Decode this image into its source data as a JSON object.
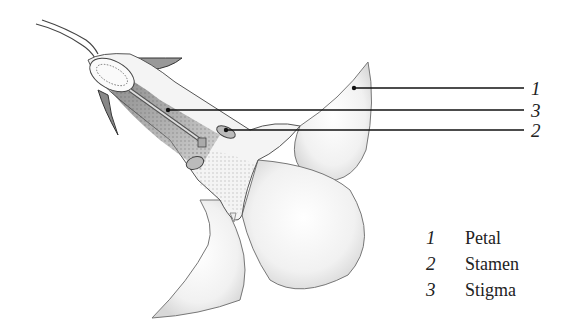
{
  "diagram": {
    "callouts": [
      {
        "number": "1",
        "target": "Petal",
        "y": 88
      },
      {
        "number": "3",
        "target": "Stigma",
        "y": 110
      },
      {
        "number": "2",
        "target": "Stamen",
        "y": 130
      }
    ],
    "legend": [
      {
        "number": "1",
        "label": "Petal"
      },
      {
        "number": "2",
        "label": "Stamen"
      },
      {
        "number": "3",
        "label": "Stigma"
      }
    ]
  }
}
